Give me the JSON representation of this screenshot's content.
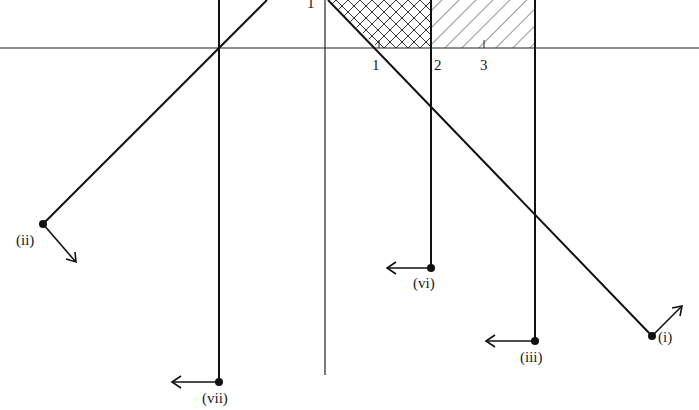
{
  "diagram": {
    "axes": {
      "x_axis_y": 48,
      "y_axis_x": 325,
      "tick_labels": [
        {
          "text": "1",
          "x": 372,
          "y": 58
        },
        {
          "text": "2",
          "x": 434,
          "y": 58
        },
        {
          "text": "3",
          "x": 480,
          "y": 58
        }
      ],
      "y_tick_label": {
        "text": "1",
        "x": 307,
        "y": -4
      }
    },
    "lines": [
      {
        "id": "i",
        "label": "(i)",
        "from": [
          328,
          0
        ],
        "to": [
          652,
          336
        ],
        "arrow_to": [
          682,
          306
        ]
      },
      {
        "id": "ii",
        "label": "(ii)",
        "from": [
          267,
          0
        ],
        "to": [
          43,
          224
        ],
        "arrow_to": [
          75,
          262
        ]
      },
      {
        "id": "iii",
        "label": "(iii)",
        "x": 535,
        "from_y": 0,
        "to_y": 341,
        "arrow_to_x": 486
      },
      {
        "id": "vi",
        "label": "(vi)",
        "x": 431,
        "from_y": 0,
        "to_y": 268,
        "arrow_to_x": 387
      },
      {
        "id": "vii",
        "label": "(vii)",
        "x": 219,
        "from_y": 0,
        "to_y": 382,
        "arrow_to_x": 172
      }
    ],
    "labels": {
      "i": "(i)",
      "ii": "(ii)",
      "iii": "(iii)",
      "vi": "(vi)",
      "vii": "(vii)"
    },
    "regions": [
      {
        "name": "cross-hatched",
        "description": "between line (i), y-axis top, and x=2 above x-axis"
      },
      {
        "name": "single-hatched",
        "description": "between x=2 and x=(iii) above x-axis"
      }
    ]
  }
}
